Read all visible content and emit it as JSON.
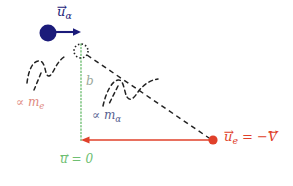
{
  "figure": {
    "background_color": "#ffffff",
    "width": 293,
    "height": 186
  },
  "colors": {
    "alpha_navy": "#1b1b7a",
    "electron_red": "#e0402a",
    "impact_green": "#6fbf73",
    "dash_black": "#222222",
    "label_b_gray": "#9aa79a"
  },
  "elements": {
    "alpha_particle": {
      "name": "alpha-particle-dot",
      "color": "#1b1b7a",
      "cx": 48,
      "cy": 33,
      "r": 8
    },
    "electron_particle": {
      "name": "electron-dot",
      "color": "#e0402a",
      "cx": 213,
      "cy": 140,
      "r": 4.5
    },
    "scatter_center": {
      "name": "scattering-center-dotted-circle",
      "cx": 81,
      "cy": 51,
      "r": 7
    }
  },
  "labels": {
    "u_alpha": {
      "text": "u",
      "subscript": "α",
      "vector": true,
      "color": "#1b1b7a",
      "x": 57,
      "y": 6,
      "font_size": 13
    },
    "prop_me": {
      "symbol": "∝",
      "text": "m",
      "subscript": "e",
      "color": "#e08a80",
      "x": 16,
      "y": 97,
      "font_size": 12
    },
    "prop_malpha": {
      "symbol": "∝",
      "text": "m",
      "subscript": "α",
      "color": "#55608f",
      "x": 92,
      "y": 110,
      "font_size": 12
    },
    "impact_parameter": {
      "text": "b",
      "color": "#9aa79a",
      "x": 86,
      "y": 76,
      "font_size": 11
    },
    "u_zero": {
      "text": "u",
      "equals": " = 0",
      "vector": true,
      "color": "#6fbf73",
      "x": 60,
      "y": 154,
      "font_size": 12
    },
    "u_e_equals": {
      "text": "u",
      "subscript": "e",
      "equals": " = −",
      "vtext": "V",
      "vector": true,
      "color": "#e0402a",
      "x": 224,
      "y": 131,
      "font_size": 13
    }
  },
  "vectors": {
    "alpha_velocity_arrow": {
      "name": "alpha-velocity-arrow",
      "color": "#1b1b7a",
      "x1": 55,
      "y1": 32,
      "x2": 80,
      "y2": 32
    },
    "electron_velocity_arrow": {
      "name": "electron-velocity-arrow",
      "color": "#e0402a",
      "x1": 210,
      "y1": 140,
      "x2": 82,
      "y2": 140
    }
  },
  "lines": {
    "impact_parameter_line": {
      "name": "impact-parameter-dotted-line",
      "color": "#6fbf73",
      "x1": 81,
      "y1": 44,
      "x2": 81,
      "y2": 141,
      "style": "dotted"
    },
    "trajectory_dashed": {
      "name": "electron-trajectory-dashed-line",
      "color": "#222222",
      "x1": 86,
      "y1": 54,
      "x2": 209,
      "y2": 138,
      "style": "dashed"
    }
  },
  "braces": {
    "left_brace": {
      "name": "me-scale-brace",
      "color": "#222222",
      "leader_from": [
        32,
        92
      ],
      "leader_to": [
        40,
        73
      ]
    },
    "right_brace": {
      "name": "malpha-scale-brace",
      "color": "#222222",
      "leader_from": [
        100,
        105
      ],
      "leader_to": [
        110,
        90
      ]
    }
  }
}
